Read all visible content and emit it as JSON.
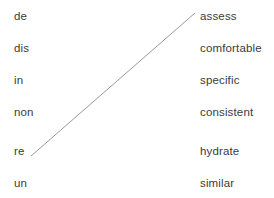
{
  "canvas": {
    "width": 274,
    "height": 198,
    "background_color": "#ffffff"
  },
  "style": {
    "text_color": "#3b3b3b",
    "line_color": "#8d8d8d"
  },
  "left_column": {
    "name": "prefixes",
    "items": [
      {
        "label": "de"
      },
      {
        "label": "dis"
      },
      {
        "label": "in"
      },
      {
        "label": "non"
      },
      {
        "label": "re"
      },
      {
        "label": "un"
      }
    ]
  },
  "right_column": {
    "name": "base-words",
    "items": [
      {
        "label": "assess"
      },
      {
        "label": "comfortable"
      },
      {
        "label": "specific"
      },
      {
        "label": "consistent"
      },
      {
        "label": "hydrate"
      },
      {
        "label": "similar"
      }
    ]
  },
  "connections": [
    {
      "from": "re",
      "to": "assess",
      "x1": 31,
      "y1": 156,
      "x2": 195,
      "y2": 13
    }
  ]
}
